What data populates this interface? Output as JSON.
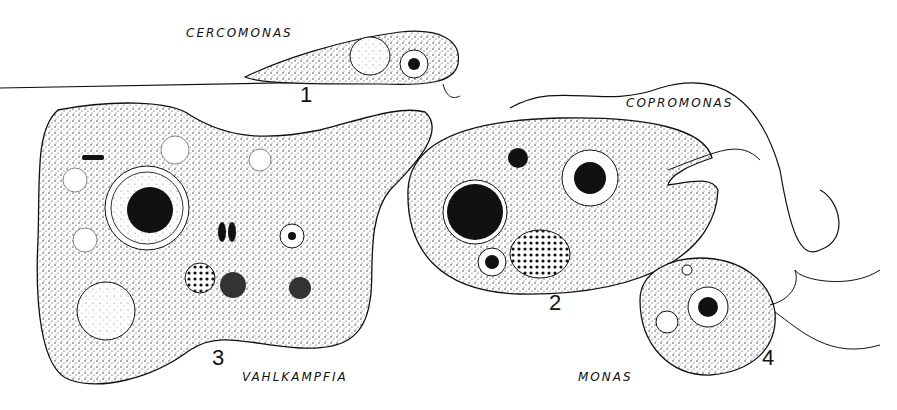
{
  "figure": {
    "organisms": [
      {
        "number": "1",
        "name": "CERCOMONAS"
      },
      {
        "number": "2",
        "name": "COPROMONAS"
      },
      {
        "number": "3",
        "name": "VAHLKAMPFIA"
      },
      {
        "number": "4",
        "name": "MONAS"
      }
    ]
  }
}
